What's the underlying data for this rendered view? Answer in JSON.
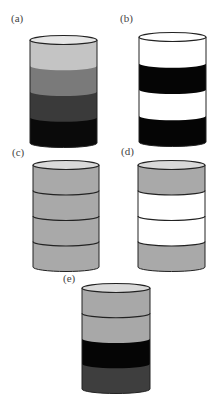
{
  "figure": {
    "panels": [
      {
        "label": "(a)",
        "label_pos": [
          11,
          22
        ],
        "cylinder": {
          "x": 30,
          "top": 40,
          "width": 67,
          "band_height": 25.75,
          "ellipse_ry": 4.5
        },
        "bands": [
          "#c4c4c4",
          "#7a7a7a",
          "#3a3a3a",
          "#0a0a0a"
        ],
        "band_separators": false,
        "top_ellipse_fill": "#e6e6e6"
      },
      {
        "label": "(b)",
        "label_pos": [
          120,
          22
        ],
        "cylinder": {
          "x": 139,
          "top": 37,
          "width": 67,
          "band_height": 26.25,
          "ellipse_ry": 4.5
        },
        "bands": [
          "#ffffff",
          "#050505",
          "#ffffff",
          "#050505"
        ],
        "band_separators": false,
        "top_ellipse_fill": "#ffffff"
      },
      {
        "label": "(c)",
        "label_pos": [
          12,
          156
        ],
        "cylinder": {
          "x": 33,
          "top": 165,
          "width": 66,
          "band_height": 25.5,
          "ellipse_ry": 4.5
        },
        "bands": [
          "#a9a9a9",
          "#a9a9a9",
          "#a9a9a9",
          "#a9a9a9"
        ],
        "band_separators": true,
        "top_ellipse_fill": "#d9d9d9"
      },
      {
        "label": "(d)",
        "label_pos": [
          121,
          155
        ],
        "cylinder": {
          "x": 138,
          "top": 165,
          "width": 67,
          "band_height": 25.5,
          "ellipse_ry": 4.5
        },
        "bands": [
          "#a9a9a9",
          "#ffffff",
          "#ffffff",
          "#a9a9a9"
        ],
        "band_separators": true,
        "top_ellipse_fill": "#d9d9d9"
      },
      {
        "label": "(e)",
        "label_pos": [
          63,
          282
        ],
        "cylinder": {
          "x": 82,
          "top": 288,
          "width": 68,
          "band_height": 25.25,
          "ellipse_ry": 4.5
        },
        "bands": [
          "#a8a8a8",
          "#a8a8a8",
          "#050505",
          "#3e3e3e"
        ],
        "band_separators": true,
        "separator_indices": [
          0
        ],
        "top_ellipse_fill": "#d9d9d9"
      }
    ],
    "stroke_color": "#222222",
    "background": "#ffffff"
  }
}
